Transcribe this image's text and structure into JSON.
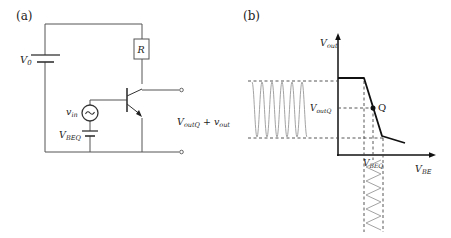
{
  "panels": {
    "a": {
      "label": "(a)",
      "components": {
        "battery_v0": {
          "label": "V",
          "sub": "0"
        },
        "resistor": {
          "label": "R"
        },
        "ac_source": {
          "label": "v",
          "sub": "in"
        },
        "bias_battery": {
          "label": "V",
          "sub": "BEQ"
        },
        "output": {
          "label_main": "V",
          "label_main_sub": "outQ",
          "plus": "+",
          "label_sig": "v",
          "label_sig_sub": "out"
        }
      }
    },
    "b": {
      "label": "(b)",
      "y_axis": {
        "label": "V",
        "sub": "out"
      },
      "x_axis": {
        "label": "V",
        "sub": "BE"
      },
      "operating_point": {
        "label": "Q"
      },
      "y_tick": {
        "label": "V",
        "sub": "outQ"
      },
      "x_tick": {
        "label": "V",
        "sub": "BEQ"
      }
    }
  },
  "colors": {
    "line": "#1a1a1a",
    "wire": "#555555",
    "signal": "#999999",
    "dash": "#444444"
  }
}
